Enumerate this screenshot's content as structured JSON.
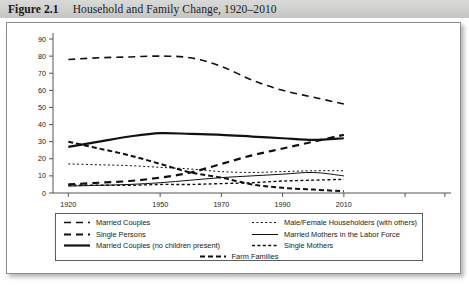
{
  "caption": {
    "figure_number": "Figure 2.1",
    "title": "Household and Family Change, 1920–2010"
  },
  "chart_data": {
    "type": "line",
    "title": "Household and Family Change, 1920–2010",
    "xlabel": "",
    "ylabel": "",
    "x": [
      1920,
      1930,
      1940,
      1950,
      1960,
      1970,
      1980,
      1990,
      2000,
      2010
    ],
    "xticks": [
      1920,
      1950,
      1970,
      1990,
      2010
    ],
    "xtick_labels": [
      "1920",
      "1950",
      "1970",
      "1990",
      "2010"
    ],
    "xlim": [
      1915,
      2045
    ],
    "yticks": [
      0,
      10,
      20,
      30,
      40,
      50,
      60,
      70,
      80,
      90
    ],
    "ytick_labels": [
      "0",
      "10",
      "20",
      "30",
      "40",
      "50",
      "60",
      "70",
      "80",
      "90"
    ],
    "ylim": [
      0,
      90
    ],
    "grid": false,
    "legend_position": "below-plot",
    "series": [
      {
        "name": "Married Couples",
        "style": "dashed",
        "width": 1.6,
        "values": [
          78,
          79,
          79.5,
          80,
          79,
          74,
          66,
          60,
          56,
          52
        ]
      },
      {
        "name": "Single Persons",
        "style": "dashed-thick",
        "width": 2.2,
        "values": [
          5,
          6,
          7,
          9,
          12,
          17,
          22,
          26,
          30,
          34
        ]
      },
      {
        "name": "Married Couples (no children present)",
        "style": "solid-thick",
        "width": 2.2,
        "values": [
          27,
          30,
          33,
          35,
          34.5,
          34,
          33,
          32,
          31,
          32
        ]
      },
      {
        "name": "Male/Female Householders (with others)",
        "style": "dotted-fine",
        "width": 1.0,
        "values": [
          17,
          16.5,
          16,
          15,
          14,
          12.5,
          12,
          12.5,
          13,
          13
        ]
      },
      {
        "name": "Married Mothers in the Labor Force",
        "style": "solid-thin",
        "width": 1.0,
        "values": [
          4,
          4.5,
          5,
          6,
          7.5,
          9,
          10,
          11,
          12,
          10
        ]
      },
      {
        "name": "Single Mothers",
        "style": "dotted",
        "width": 1.4,
        "values": [
          4.5,
          4.5,
          4.5,
          5,
          5,
          5.5,
          6,
          7,
          7.5,
          8
        ]
      },
      {
        "name": "Farm Families",
        "style": "dashed-bold",
        "width": 2.0,
        "values": [
          30,
          26,
          22,
          17,
          12,
          9,
          5,
          3,
          2,
          1
        ]
      }
    ]
  },
  "legend": {
    "left_column": [
      {
        "label": "Married Couples",
        "swatch": "dashed"
      },
      {
        "label": "Single Persons",
        "swatch": "dashed-thick"
      },
      {
        "label": "Married Couples (no children present)",
        "swatch": "solid-thick"
      }
    ],
    "right_column": [
      {
        "label": "Male/Female Householders (with others)",
        "swatch": "dotted-fine"
      },
      {
        "label": "Married Mothers in the Labor Force",
        "swatch": "solid-thin"
      },
      {
        "label": "Single Mothers",
        "swatch": "dotted"
      }
    ],
    "bottom_row": [
      {
        "label": "Farm Families",
        "swatch": "dashed-bold"
      }
    ]
  },
  "colors": {
    "line": "#111111",
    "axis": "#555555",
    "panel_border": "#8d8d8d",
    "caption_band": "#d2d2d0",
    "text": "#1a1a1a"
  }
}
